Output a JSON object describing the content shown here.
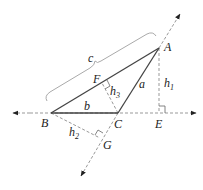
{
  "diagram": {
    "colors": {
      "solid": "#444444",
      "dashed": "#999999",
      "brace": "#aaaaaa",
      "text": "#222222"
    },
    "points": {
      "A": {
        "label": "A",
        "x": 159,
        "y": 48
      },
      "B": {
        "label": "B",
        "x": 51,
        "y": 113
      },
      "C": {
        "label": "C",
        "x": 118,
        "y": 113
      },
      "E": {
        "label": "E",
        "x": 159,
        "y": 113
      },
      "F": {
        "label": "F",
        "x": 102,
        "y": 83
      },
      "G": {
        "label": "G",
        "x": 100,
        "y": 138
      }
    },
    "sides": {
      "a": "a",
      "b": "b",
      "c": "c"
    },
    "altitudes": {
      "h1": {
        "base": "h",
        "sub": "1"
      },
      "h2": {
        "base": "h",
        "sub": "2"
      },
      "h3": {
        "base": "h",
        "sub": "3"
      }
    }
  }
}
